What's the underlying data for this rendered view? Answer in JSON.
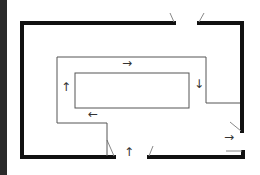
{
  "diagram": {
    "type": "floor-plan-circulation",
    "colors": {
      "background": "#ffffff",
      "wall": "#111111",
      "path_line": "#555555",
      "door_swing": "#888888",
      "arrow": "#333333",
      "left_strip": "#2a2a2a"
    },
    "arrows": [
      {
        "id": "top",
        "glyph": "→",
        "x": 127,
        "y": 63
      },
      {
        "id": "right",
        "glyph": "↓",
        "x": 199,
        "y": 84
      },
      {
        "id": "bottom",
        "glyph": "←",
        "x": 93,
        "y": 114
      },
      {
        "id": "left",
        "glyph": "↑",
        "x": 66,
        "y": 87
      },
      {
        "id": "exit-right",
        "glyph": "→",
        "x": 229,
        "y": 137
      },
      {
        "id": "entry-bottom",
        "glyph": "↑",
        "x": 129,
        "y": 152
      }
    ],
    "doors": [
      "top-entrance",
      "bottom-entrance",
      "right-exit"
    ]
  }
}
